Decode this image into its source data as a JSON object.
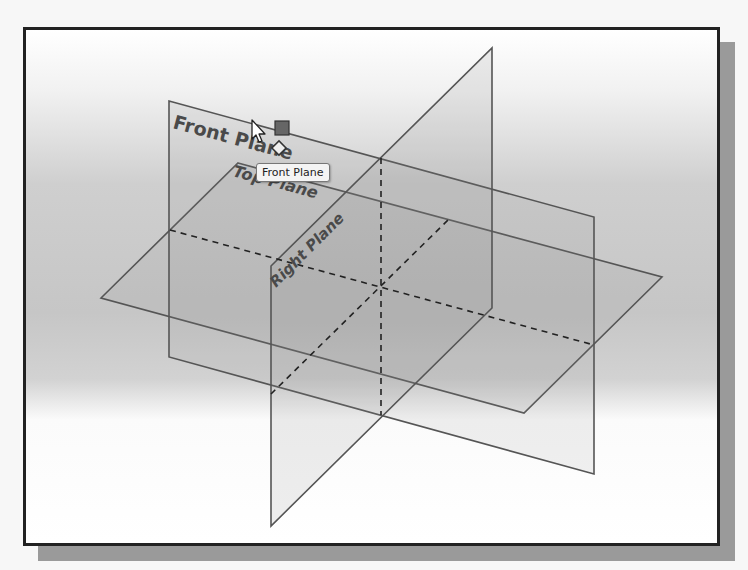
{
  "viewport": {
    "background_gradient": [
      "#ffffff",
      "#c6c6c6",
      "#ffffff"
    ],
    "frame_color": "#222222",
    "shadow_color": "#9a9a9a"
  },
  "planes": {
    "front": {
      "label": "Front Plane",
      "color": "#555555"
    },
    "top": {
      "label": "Top Plane",
      "color": "#555555"
    },
    "right": {
      "label": "Right Plane",
      "color": "#555555"
    }
  },
  "tooltip": {
    "text": "Front Plane"
  },
  "cursor": {
    "icon": "arrow-cursor-icon"
  },
  "icons": {
    "selection_handle": "square-handle-icon",
    "plane_feature": "plane-icon"
  }
}
